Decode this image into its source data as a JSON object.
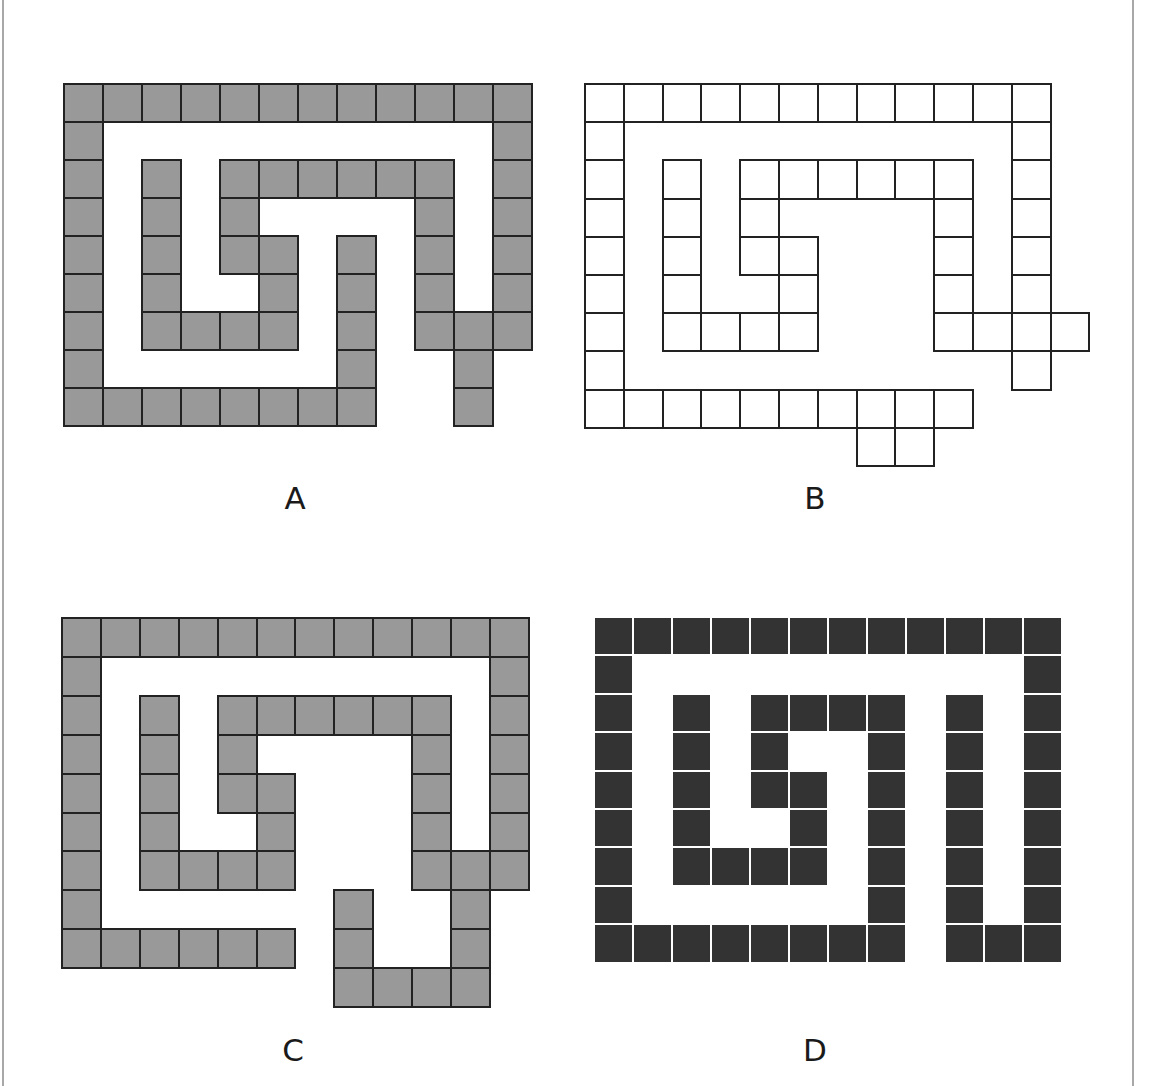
{
  "figures": [
    {
      "id": "A",
      "label": "A",
      "style": "gray",
      "origin": [
        63,
        83
      ],
      "cell": [
        39,
        38
      ],
      "label_pos": [
        295,
        483
      ],
      "rows": [
        [
          0,
          1,
          2,
          3,
          4,
          5,
          6,
          7,
          8,
          9,
          10,
          11
        ],
        [
          0,
          11
        ],
        [
          0,
          2,
          4,
          5,
          6,
          7,
          8,
          9,
          11
        ],
        [
          0,
          2,
          4,
          9,
          11
        ],
        [
          0,
          2,
          4,
          5,
          7,
          9,
          11
        ],
        [
          0,
          2,
          5,
          7,
          9,
          11
        ],
        [
          0,
          2,
          3,
          4,
          5,
          7,
          9,
          10,
          11
        ],
        [
          0,
          7,
          10
        ],
        [
          0,
          1,
          2,
          3,
          4,
          5,
          6,
          7,
          10
        ]
      ]
    },
    {
      "id": "B",
      "label": "B",
      "style": "white",
      "origin": [
        584,
        83
      ],
      "cell": [
        38.8,
        38.2
      ],
      "label_pos": [
        815,
        483
      ],
      "rows": [
        [
          0,
          1,
          2,
          3,
          4,
          5,
          6,
          7,
          8,
          9,
          10,
          11
        ],
        [
          0,
          11
        ],
        [
          0,
          2,
          4,
          5,
          6,
          7,
          8,
          9,
          11
        ],
        [
          0,
          2,
          4,
          9,
          11
        ],
        [
          0,
          2,
          4,
          5,
          9,
          11
        ],
        [
          0,
          2,
          5,
          9,
          11
        ],
        [
          0,
          2,
          3,
          4,
          5,
          9,
          10,
          11,
          12
        ],
        [
          0,
          11
        ],
        [
          0,
          1,
          2,
          3,
          4,
          5,
          6,
          7,
          8,
          9
        ],
        [
          7,
          8
        ]
      ]
    },
    {
      "id": "C",
      "label": "C",
      "style": "gray",
      "origin": [
        61,
        617
      ],
      "cell": [
        38.9,
        38.9
      ],
      "label_pos": [
        293,
        1035
      ],
      "rows": [
        [
          0,
          1,
          2,
          3,
          4,
          5,
          6,
          7,
          8,
          9,
          10,
          11
        ],
        [
          0,
          11
        ],
        [
          0,
          2,
          4,
          5,
          6,
          7,
          8,
          9,
          11
        ],
        [
          0,
          2,
          4,
          9,
          11
        ],
        [
          0,
          2,
          4,
          5,
          9,
          11
        ],
        [
          0,
          2,
          5,
          9,
          11
        ],
        [
          0,
          2,
          3,
          4,
          5,
          9,
          10,
          11
        ],
        [
          0,
          7,
          10
        ],
        [
          0,
          1,
          2,
          3,
          4,
          5,
          7,
          10
        ],
        [
          7,
          8,
          9,
          10
        ]
      ]
    },
    {
      "id": "D",
      "label": "D",
      "style": "dark",
      "origin": [
        594,
        617
      ],
      "cell": [
        39,
        38.4
      ],
      "label_pos": [
        815,
        1035
      ],
      "rows": [
        [
          0,
          1,
          2,
          3,
          4,
          5,
          6,
          7,
          8,
          9,
          10,
          11
        ],
        [
          0,
          11
        ],
        [
          0,
          2,
          4,
          5,
          6,
          7,
          9,
          11
        ],
        [
          0,
          2,
          4,
          7,
          9,
          11
        ],
        [
          0,
          2,
          4,
          5,
          7,
          9,
          11
        ],
        [
          0,
          2,
          5,
          7,
          9,
          11
        ],
        [
          0,
          2,
          3,
          4,
          5,
          7,
          9,
          11
        ],
        [
          0,
          7,
          9,
          11
        ],
        [
          0,
          1,
          2,
          3,
          4,
          5,
          6,
          7,
          9,
          10,
          11
        ]
      ]
    }
  ],
  "colors": {
    "gray_fill": "#999999",
    "dark_fill": "#333333",
    "outline": "#222222",
    "frame_line": "#a8a8a8"
  }
}
